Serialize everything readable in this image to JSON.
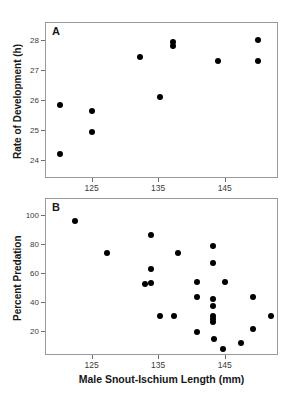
{
  "figure": {
    "xlabel": "Male Snout-Ischium Length (mm)",
    "background": "#ffffff",
    "marker_color": "#000000",
    "frame_color": "#9a9a9a"
  },
  "chart_data": [
    {
      "type": "scatter",
      "panel": "A",
      "title": "",
      "xlabel": "Male Snout-Ischium Length (mm)",
      "ylabel": "Rate of Development (h)",
      "xlim": [
        118,
        153
      ],
      "ylim": [
        23.4,
        28.6
      ],
      "xticks": [
        125,
        135,
        145
      ],
      "yticks": [
        24,
        25,
        26,
        27,
        28
      ],
      "xtick_labels": [
        "125",
        "135",
        "145"
      ],
      "ytick_labels": [
        "24",
        "25",
        "26",
        "27",
        "28"
      ],
      "grid": false,
      "legend": "none",
      "points": [
        {
          "x": 120.3,
          "y": 25.85
        },
        {
          "x": 120.3,
          "y": 24.2
        },
        {
          "x": 125.0,
          "y": 25.65
        },
        {
          "x": 125.0,
          "y": 24.95
        },
        {
          "x": 132.3,
          "y": 27.45
        },
        {
          "x": 135.2,
          "y": 26.1
        },
        {
          "x": 137.3,
          "y": 27.95
        },
        {
          "x": 137.3,
          "y": 27.8
        },
        {
          "x": 144.0,
          "y": 27.3
        },
        {
          "x": 150.0,
          "y": 28.0
        },
        {
          "x": 150.0,
          "y": 27.3
        }
      ]
    },
    {
      "type": "scatter",
      "panel": "B",
      "title": "",
      "xlabel": "Male Snout-Ischium Length (mm)",
      "ylabel": "Percent Predation",
      "xlim": [
        118,
        153
      ],
      "ylim": [
        3,
        112
      ],
      "xticks": [
        125,
        135,
        145
      ],
      "yticks": [
        20,
        40,
        60,
        80,
        100
      ],
      "xtick_labels": [
        "125",
        "135",
        "145"
      ],
      "ytick_labels": [
        "20",
        "40",
        "60",
        "80",
        "100"
      ],
      "grid": false,
      "legend": "none",
      "points": [
        {
          "x": 122.5,
          "y": 96
        },
        {
          "x": 127.3,
          "y": 74
        },
        {
          "x": 133.0,
          "y": 52
        },
        {
          "x": 133.9,
          "y": 86
        },
        {
          "x": 133.9,
          "y": 63
        },
        {
          "x": 133.9,
          "y": 53
        },
        {
          "x": 135.3,
          "y": 30
        },
        {
          "x": 137.4,
          "y": 30
        },
        {
          "x": 138.0,
          "y": 74
        },
        {
          "x": 140.8,
          "y": 54
        },
        {
          "x": 140.8,
          "y": 43
        },
        {
          "x": 140.8,
          "y": 19
        },
        {
          "x": 143.2,
          "y": 79
        },
        {
          "x": 143.2,
          "y": 67
        },
        {
          "x": 143.2,
          "y": 42
        },
        {
          "x": 143.2,
          "y": 37
        },
        {
          "x": 143.2,
          "y": 30
        },
        {
          "x": 143.2,
          "y": 28
        },
        {
          "x": 143.2,
          "y": 26
        },
        {
          "x": 143.4,
          "y": 14
        },
        {
          "x": 145.0,
          "y": 54
        },
        {
          "x": 144.7,
          "y": 7
        },
        {
          "x": 147.5,
          "y": 11
        },
        {
          "x": 149.3,
          "y": 43
        },
        {
          "x": 149.3,
          "y": 21
        },
        {
          "x": 152.0,
          "y": 30
        }
      ]
    }
  ]
}
